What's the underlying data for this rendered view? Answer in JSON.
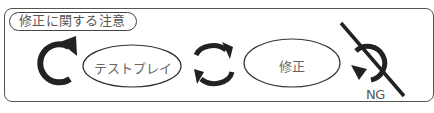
{
  "title": "修正に関する注意",
  "steps": [
    {
      "label": "テストプレイ",
      "shape": "ellipse"
    },
    {
      "label": "修正",
      "shape": "ellipse"
    }
  ],
  "icons": {
    "loop": "clockwise-circular-arrow-icon",
    "cycle": "double-cycle-arrows-icon",
    "ng": "prohibited-reverse-arrow-icon"
  },
  "ng_label": "NG",
  "colors": {
    "stroke": "#222222",
    "border": "#555555",
    "text": "#666666",
    "background": "#ffffff"
  }
}
